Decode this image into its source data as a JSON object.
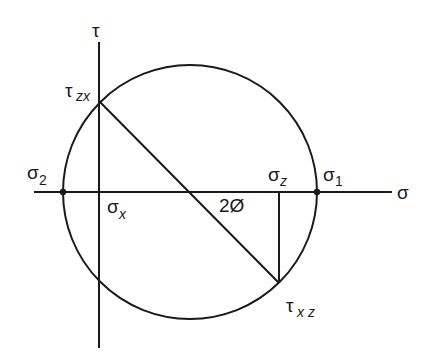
{
  "diagram": {
    "colors": {
      "stroke": "#1a1a1a",
      "background": "#ffffff"
    },
    "axes": {
      "horizontal": {
        "label": "σ",
        "x1": 34,
        "x2": 392,
        "y": 192
      },
      "vertical": {
        "label": "τ",
        "x": 99,
        "y1": 42,
        "y2": 348
      }
    },
    "circle": {
      "cx": 190,
      "cy": 192,
      "r": 127
    },
    "points": {
      "sigma2": {
        "x": 63,
        "y": 192
      },
      "sigma1": {
        "x": 317,
        "y": 192
      },
      "tau_zx": {
        "x": 99,
        "y": 101
      },
      "tau_xz": {
        "x": 279,
        "y": 283
      }
    },
    "labels": {
      "tau_axis": "τ",
      "sigma_axis": "σ",
      "tau_zx_main": "τ",
      "tau_zx_sub": "zx",
      "sigma2_main": "σ",
      "sigma2_sub": "2",
      "sigma_x_main": "σ",
      "sigma_x_sub": "x",
      "sigma_z_main": "σ",
      "sigma_z_sub": "z",
      "sigma1_main": "σ",
      "sigma1_sub": "1",
      "angle": "2Ø",
      "tau_xz_main": "τ",
      "tau_xz_sub": "x z"
    }
  }
}
